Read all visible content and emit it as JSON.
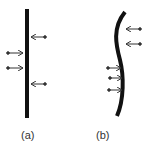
{
  "panels": [
    {
      "id": "a",
      "label": "(a)",
      "description": "straight beam with opposing arrows"
    },
    {
      "id": "b",
      "label": "(b)",
      "description": "curved S-shaped beam with opposing arrows"
    }
  ],
  "colors": {
    "beam": "#111111",
    "arrow": "#333333"
  }
}
